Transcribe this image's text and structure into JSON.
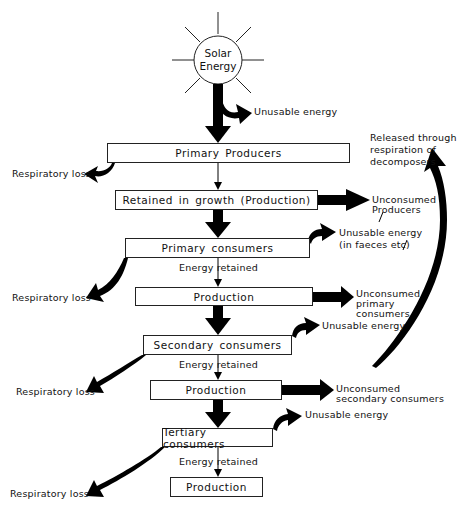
{
  "diagram": {
    "type": "energy-flow",
    "source": {
      "label_line1": "Solar",
      "label_line2": "Energy"
    },
    "levels": [
      {
        "name": "Primary Producers"
      },
      {
        "name": "Retained in growth (Production)"
      },
      {
        "name": "Primary consumers"
      },
      {
        "name": "Production"
      },
      {
        "name": "Secondary consumers"
      },
      {
        "name": "Production"
      },
      {
        "name": "Tertiary consumers"
      },
      {
        "name": "Production"
      }
    ],
    "labels": {
      "unusable_energy": "Unusable energy",
      "respiratory_loss": "Respiratory loss",
      "energy_retained": "Energy retained",
      "decomposers_line1": "Released through",
      "decomposers_line2": "respiration of",
      "decomposers_line3": "decomposers",
      "unconsumed_producers_line1": "Unconsumed",
      "unconsumed_producers_line2": "Producers",
      "unusable_faeces_line1": "Unusable energy",
      "unusable_faeces_line2": "(in faeces etc)",
      "unconsumed_primary_line1": "Unconsumed",
      "unconsumed_primary_line2": "primary",
      "unconsumed_primary_line3": "consumers",
      "unconsumed_secondary_line1": "Unconsumed",
      "unconsumed_secondary_line2": "secondary consumers"
    }
  }
}
